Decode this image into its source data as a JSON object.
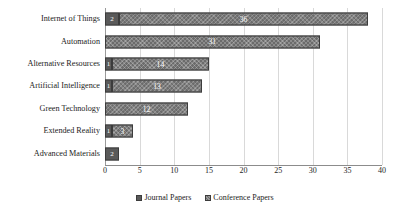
{
  "chart_data": {
    "type": "bar",
    "orientation": "horizontal",
    "stacked": true,
    "title": "",
    "xlabel": "",
    "ylabel": "",
    "xlim": [
      0,
      40
    ],
    "xticks": [
      "0",
      "5",
      "10",
      "15",
      "20",
      "25",
      "30",
      "35",
      "40"
    ],
    "grid": true,
    "legend_position": "bottom-center",
    "categories": [
      "Internet of Things",
      "Automation",
      "Alternative Resources",
      "Artificial Intelligence",
      "Green Technology",
      "Extended Reality",
      "Advanced Materials"
    ],
    "series": [
      {
        "name": "Journal Papers",
        "color": "#5a5a5a",
        "values": [
          2,
          0,
          1,
          1,
          0,
          1,
          2
        ]
      },
      {
        "name": "Conference Papers",
        "color": "#6b6b6b",
        "values": [
          36,
          31,
          14,
          13,
          12,
          3,
          0
        ]
      }
    ],
    "bar_labels": [
      {
        "category": "Internet of Things",
        "segments": [
          {
            "series": "Journal Papers",
            "label": "2"
          },
          {
            "series": "Conference Papers",
            "label": "36"
          }
        ]
      },
      {
        "category": "Automation",
        "segments": [
          {
            "series": "Conference Papers",
            "label": "31"
          }
        ]
      },
      {
        "category": "Alternative Resources",
        "segments": [
          {
            "series": "Journal Papers",
            "label": "1"
          },
          {
            "series": "Conference Papers",
            "label": "14"
          }
        ]
      },
      {
        "category": "Artificial Intelligence",
        "segments": [
          {
            "series": "Journal Papers",
            "label": "1"
          },
          {
            "series": "Conference Papers",
            "label": "13"
          }
        ]
      },
      {
        "category": "Green Technology",
        "segments": [
          {
            "series": "Conference Papers",
            "label": "12"
          }
        ]
      },
      {
        "category": "Extended Reality",
        "segments": [
          {
            "series": "Journal Papers",
            "label": "1"
          },
          {
            "series": "Conference Papers",
            "label": "3"
          }
        ]
      },
      {
        "category": "Advanced Materials",
        "segments": [
          {
            "series": "Journal Papers",
            "label": "2"
          }
        ]
      }
    ]
  },
  "legend": {
    "items": [
      {
        "label": "Journal Papers"
      },
      {
        "label": "Conference Papers"
      }
    ]
  }
}
